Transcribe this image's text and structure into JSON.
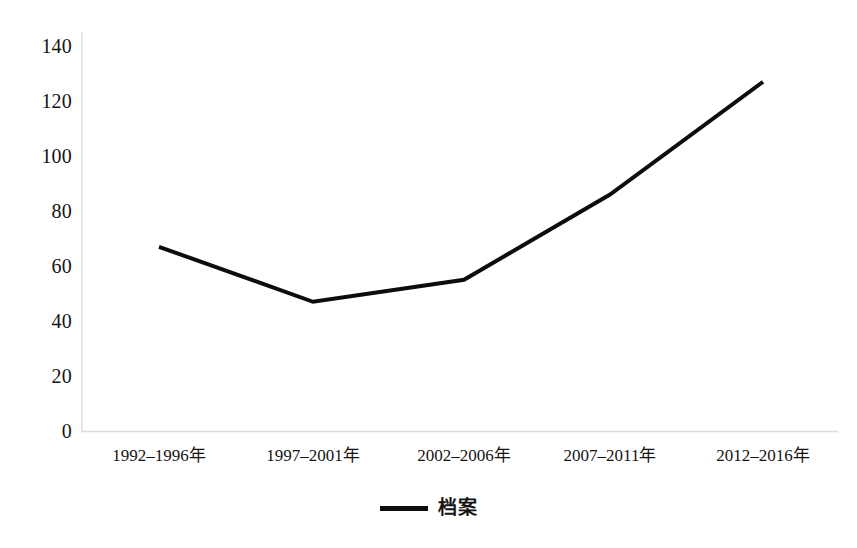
{
  "chart_data": {
    "type": "line",
    "title": "",
    "subtitle": "",
    "xlabel": "",
    "ylabel": "",
    "categories": [
      "1992–1996年",
      "1997–2001年",
      "2002–2006年",
      "2007–2011年",
      "2012–2016年"
    ],
    "series": [
      {
        "name": "档案",
        "values": [
          67,
          47,
          55,
          86,
          127
        ],
        "color": "#0d0d0d"
      }
    ],
    "ylim": [
      0,
      140
    ],
    "y_ticks": [
      0,
      20,
      40,
      60,
      80,
      100,
      120,
      140
    ],
    "y_tick_labels": [
      "0",
      "20",
      "40",
      "60",
      "80",
      "100",
      "120",
      "140"
    ],
    "grid": false,
    "legend": {
      "position": "bottom",
      "entries": [
        {
          "label": "档案",
          "marker": "line",
          "color": "#0d0d0d"
        }
      ]
    },
    "axis_color": "#d8d8d8",
    "line_width": 4
  },
  "legend": {
    "label": "档案"
  },
  "axes": {
    "y_labels": [
      "140",
      "120",
      "100",
      "80",
      "60",
      "40",
      "20",
      "0"
    ],
    "x_labels": [
      "1992–1996年",
      "1997–2001年",
      "2002–2006年",
      "2007–2011年",
      "2012–2016年"
    ]
  }
}
